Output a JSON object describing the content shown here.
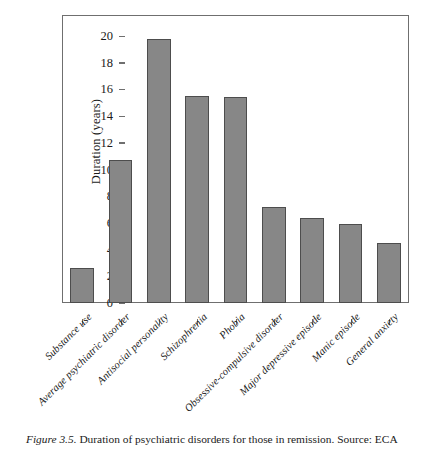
{
  "chart_data": {
    "type": "bar",
    "title": "",
    "xlabel": "",
    "ylabel": "Duration (years)",
    "ylim": [
      0,
      21.5
    ],
    "yticks": [
      0,
      2,
      4,
      6,
      8,
      10,
      12,
      14,
      16,
      18,
      20
    ],
    "grid": false,
    "legend": null,
    "bar_color": "#878787",
    "bar_edge_color": "#4d4d4d",
    "categories": [
      "Substance use",
      "Average psychiatric disorder",
      "Antisocial personality",
      "Schizophrenia",
      "Phobia",
      "Obsessive-compulsive disorder",
      "Major depressive episode",
      "Manic episode",
      "General anxiety"
    ],
    "values": [
      2.6,
      10.7,
      19.8,
      15.5,
      15.4,
      7.2,
      6.4,
      5.9,
      4.5
    ]
  },
  "caption": {
    "figure_number": "Figure 3.5.",
    "text": "Duration of psychiatric disorders for those in remission. Source: ECA"
  }
}
